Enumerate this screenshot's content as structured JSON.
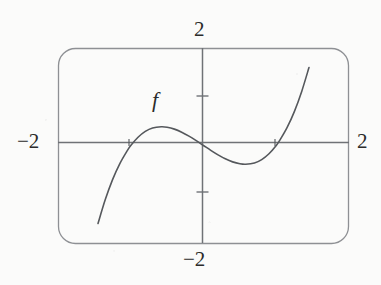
{
  "figure": {
    "title": "",
    "function_label": "f",
    "background_color": "#fbfbfa",
    "frame_color": "#8e9094",
    "axis_color": "#6f7276",
    "curve_color": "#55585c",
    "text_color": "#2b2b2b"
  },
  "labels": {
    "top": "2",
    "bottom": "−2",
    "left": "−2",
    "right": "2"
  },
  "chart_data": {
    "type": "line",
    "title": "",
    "xlabel": "",
    "ylabel": "",
    "xlim": [
      -2,
      2
    ],
    "ylim": [
      -2,
      2
    ],
    "grid": false,
    "legend": false,
    "frame": "rounded-rectangle",
    "axes_style": "centered-crosshair",
    "xticks": [
      -2,
      2
    ],
    "yticks": [
      -2,
      2
    ],
    "xtick_labels": [
      "−2",
      "2"
    ],
    "ytick_labels": [
      "−2",
      "2"
    ],
    "minor_ytick_marks": [
      1,
      -1
    ],
    "annotations": [
      {
        "text": "f",
        "x": -0.5,
        "y": 0.75,
        "style": "italic"
      }
    ],
    "series": [
      {
        "name": "f",
        "roots": [
          -1.0,
          0.0,
          1.0
        ],
        "local_maximum": {
          "x": -0.58,
          "y": 0.39
        },
        "local_minimum": {
          "x": 0.58,
          "y": -0.39
        },
        "inflection": {
          "x": 0.0,
          "y": 0.0
        },
        "expression": "x^3 - x",
        "x": [
          -1.45,
          -1.35,
          -1.25,
          -1.15,
          -1.05,
          -1.0,
          -0.9,
          -0.8,
          -0.7,
          -0.58,
          -0.5,
          -0.4,
          -0.3,
          -0.2,
          -0.1,
          0.0,
          0.1,
          0.2,
          0.3,
          0.4,
          0.5,
          0.58,
          0.7,
          0.8,
          0.9,
          1.0,
          1.05,
          1.15,
          1.25,
          1.35,
          1.45
        ],
        "y": [
          -1.6,
          -1.11,
          -0.7,
          -0.37,
          -0.11,
          0.0,
          0.17,
          0.29,
          0.36,
          0.385,
          0.375,
          0.336,
          0.273,
          0.192,
          0.099,
          0.0,
          -0.099,
          -0.192,
          -0.273,
          -0.336,
          -0.375,
          -0.385,
          -0.36,
          -0.29,
          -0.17,
          0.0,
          0.11,
          0.37,
          0.7,
          1.11,
          1.6
        ]
      }
    ]
  }
}
